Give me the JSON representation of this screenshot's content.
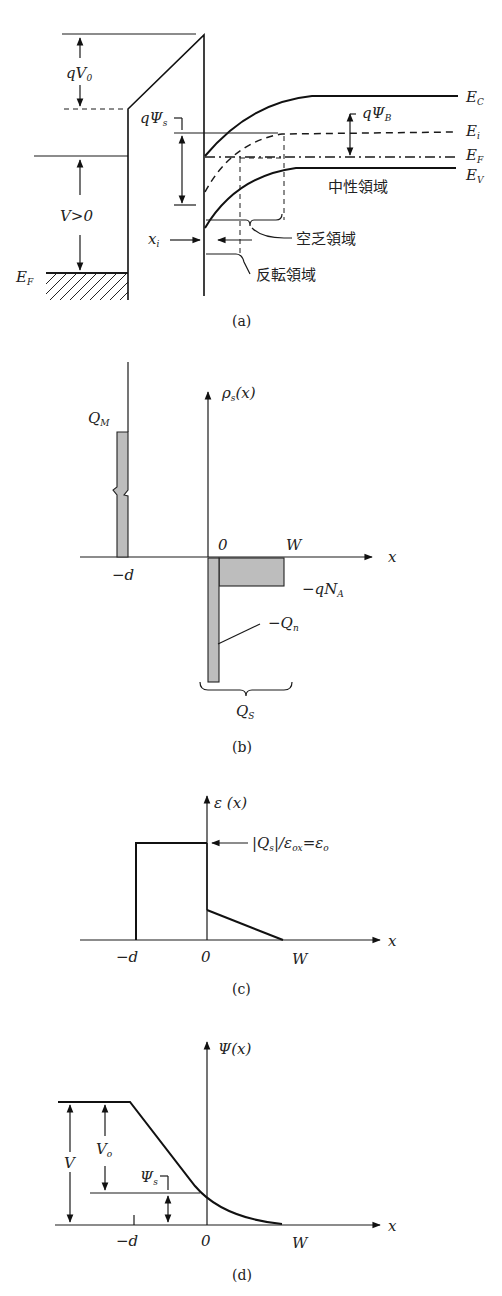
{
  "panel_a": {
    "caption": "(a)",
    "labels": {
      "qV0": "qV",
      "qV0_sub": "0",
      "qPsiS": "qΨ",
      "qPsiS_sub": "s",
      "qPsiB": "qΨ",
      "qPsiB_sub": "B",
      "V_gt_0": "V>0",
      "EF_metal": "E",
      "EF_metal_sub": "F",
      "xi": "x",
      "xi_sub": "i",
      "Ec": "E",
      "Ec_sub": "C",
      "Ei": "E",
      "Ei_sub": "i",
      "EF": "E",
      "EF_sub": "F",
      "Ev": "E",
      "Ev_sub": "V",
      "neutral_region": "中性領域",
      "depletion_region": "空乏領域",
      "inversion_region": "反転領域"
    }
  },
  "panel_b": {
    "caption": "(b)",
    "labels": {
      "rho": "ρ",
      "rho_sub": "s",
      "rho_arg": "(x)",
      "QM": "Q",
      "QM_sub": "M",
      "zero": "0",
      "W": "W",
      "x": "x",
      "minus_d": "−d",
      "minus_qNA": "−qN",
      "minus_qNA_sub": "A",
      "minus_Qn": "−Q",
      "minus_Qn_sub": "n",
      "QS": "Q",
      "QS_sub": "S"
    }
  },
  "panel_c": {
    "caption": "(c)",
    "labels": {
      "E_axis": "ε (x)",
      "annot": "|Q",
      "annot_sub": "s",
      "annot_rest": "|/ε",
      "annot_sub2": "ox",
      "annot_eq": "=ε",
      "annot_sub3": "o",
      "minus_d": "−d",
      "zero": "0",
      "W": "W",
      "x": "x"
    }
  },
  "panel_d": {
    "caption": "(d)",
    "labels": {
      "psi_axis": "Ψ(x)",
      "V": "V",
      "Vo": "V",
      "Vo_sub": "o",
      "PsiS": "Ψ",
      "PsiS_sub": "s",
      "minus_d": "−d",
      "zero": "0",
      "W": "W",
      "x": "x"
    }
  }
}
